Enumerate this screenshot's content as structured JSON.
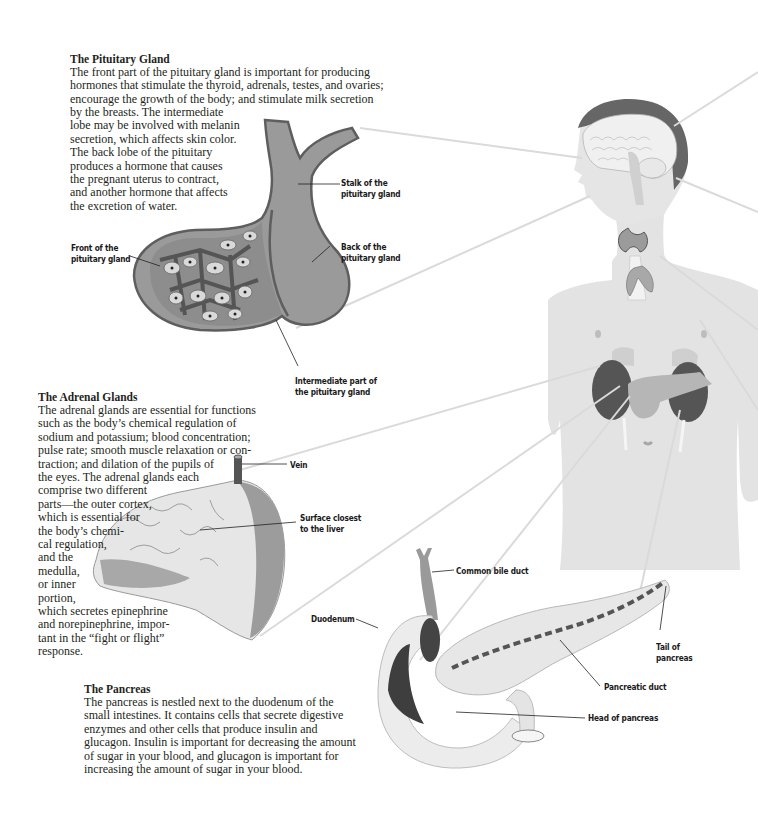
{
  "sections": {
    "pituitary": {
      "title": "The Pituitary Gland",
      "text_wide": "The front part of the pituitary gland is important for producing\nhormones that stimulate the thyroid, adrenals, testes, and ovaries;\nencourage the growth of the body; and stimulate milk secretion",
      "text_narrow": "by the breasts. The intermediate\nlobe may be involved with melanin\nsecretion, which affects skin color.\nThe back lobe of the pituitary\nproduces a hormone that causes\nthe pregnant uterus to contract,\nand another hormone that affects\nthe excretion of water.",
      "labels": {
        "stalk": "Stalk of the\npituitary gland",
        "front": "Front of the\npituitary gland",
        "back": "Back of the\npituitary gland",
        "intermediate": "Intermediate part of\nthe pituitary gland"
      }
    },
    "adrenal": {
      "title": "The Adrenal Glands",
      "text_wide": "The adrenal glands are essential for functions\nsuch as the body’s chemical regulation of\nsodium and potassium; blood concentration;\npulse rate; smooth muscle relaxation or con-\ntraction; and dilation of the pupils of",
      "text_narrow": "the eyes. The adrenal glands each\ncomprise two different\nparts—the outer cortex,\nwhich is essential for\nthe body’s chemi-\ncal regulation,\nand the\nmedulla,\nor inner\nportion,",
      "text_bottom": "which secretes epinephrine\nand norepinephrine, impor-\ntant in the “fight or flight”\nresponse.",
      "labels": {
        "vein": "Vein",
        "surface": "Surface closest\nto the liver"
      }
    },
    "pancreas": {
      "title": "The Pancreas",
      "text": "The pancreas is nestled next to the duodenum of the\nsmall intestines. It contains cells that secrete digestive\nenzymes and other cells that produce insulin and\nglucagon. Insulin is important for decreasing the amount\nof sugar in your blood, and glucagon is important for\nincreasing the amount of sugar in your blood.",
      "labels": {
        "bile_duct": "Common bile duct",
        "duodenum": "Duodenum",
        "tail": "Tail of\npancreas",
        "duct": "Pancreatic duct",
        "head": "Head of pancreas"
      }
    }
  },
  "colors": {
    "gland_fill": "#9a9a9a",
    "gland_outline": "#5a5a5a",
    "body_fill": "#e4e4e4",
    "organ_dark": "#555555",
    "leader_line": "#dcdcdc",
    "text": "#231f20"
  }
}
